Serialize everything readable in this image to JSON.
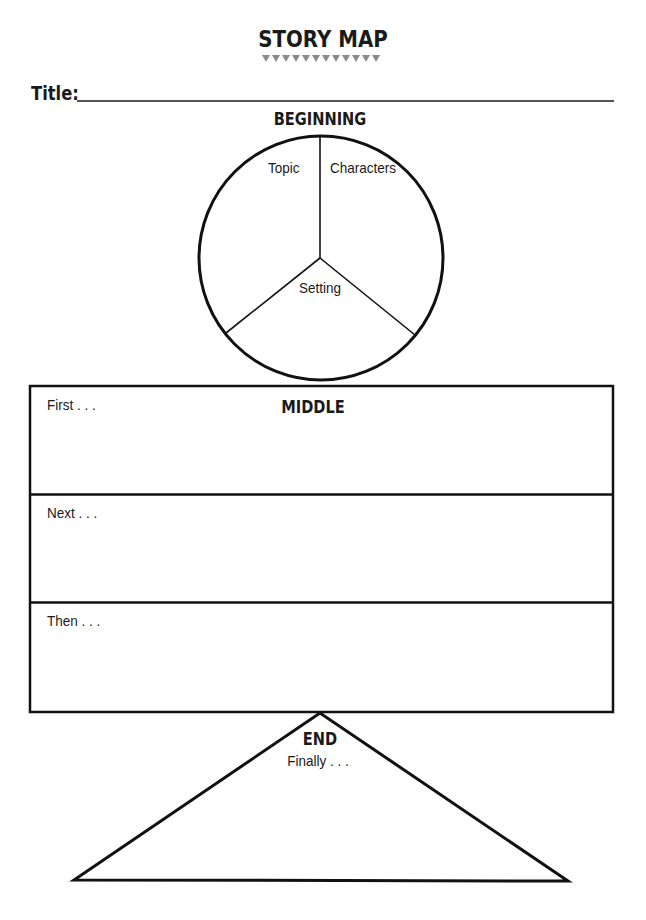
{
  "header": {
    "title": "STORY MAP",
    "decoration": "triangle-border"
  },
  "title_field": {
    "label": "Title:",
    "value": ""
  },
  "beginning": {
    "heading": "BEGINNING",
    "sections": [
      {
        "label": "Topic",
        "value": ""
      },
      {
        "label": "Characters",
        "value": ""
      },
      {
        "label": "Setting",
        "value": ""
      }
    ]
  },
  "middle": {
    "heading": "MIDDLE",
    "rows": [
      {
        "label": "First . . .",
        "value": ""
      },
      {
        "label": "Next . . .",
        "value": ""
      },
      {
        "label": "Then . . .",
        "value": ""
      }
    ]
  },
  "end": {
    "heading": "END",
    "label": "Finally . . .",
    "value": ""
  },
  "colors": {
    "ink": "#1a1a1a",
    "decoration": "#888888",
    "background": "#ffffff"
  }
}
